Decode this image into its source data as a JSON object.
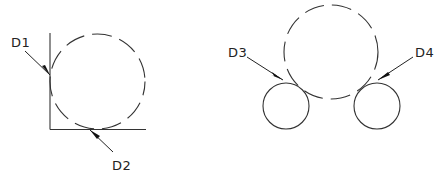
{
  "figure": {
    "left": {
      "labels": {
        "d1": "D1",
        "d2": "D2"
      },
      "description": "Dashed circle tangent to a vertical and horizontal line (corner)"
    },
    "right": {
      "labels": {
        "d3": "D3",
        "d4": "D4"
      },
      "description": "Dashed circle tangent to two solid circles"
    }
  },
  "colors": {
    "stroke": "#333333",
    "background": "#ffffff"
  }
}
